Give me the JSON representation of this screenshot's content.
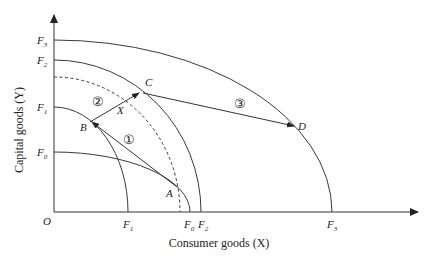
{
  "diagram": {
    "x_axis_label": "Consumer goods (X)",
    "y_axis_label": "Capital goods (Y)",
    "origin_label": "O",
    "colors": {
      "line": "#3a3a3a",
      "text": "#222222",
      "background": "#ffffff"
    },
    "frontiers": [
      {
        "name": "F0",
        "letter": "F",
        "sub": "0",
        "style": "solid"
      },
      {
        "name": "F1",
        "letter": "F",
        "sub": "1",
        "style": "solid"
      },
      {
        "name": "F2",
        "letter": "F",
        "sub": "2",
        "style": "solid"
      },
      {
        "name": "F3",
        "letter": "F",
        "sub": "3",
        "style": "solid"
      },
      {
        "name": "intermediate",
        "style": "dashed"
      }
    ],
    "points": {
      "A": "A",
      "B": "B",
      "C": "C",
      "D": "D",
      "X": "X"
    },
    "arrows": [
      {
        "id": "1",
        "label": "①",
        "from": "A",
        "to": "B"
      },
      {
        "id": "2",
        "label": "②",
        "from": "B",
        "to": "C"
      },
      {
        "id": "3",
        "label": "③",
        "from": "C",
        "to": "D"
      }
    ]
  }
}
